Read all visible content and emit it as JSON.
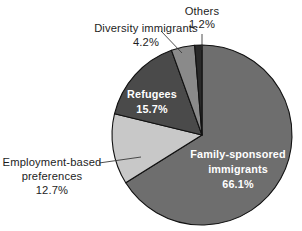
{
  "chart_data": {
    "type": "pie",
    "title": "",
    "subtitle": "",
    "xlabel": "",
    "ylabel": "",
    "legend_position": "none",
    "grid": false,
    "units": "percent",
    "total": 99.9,
    "start_angle_deg": 0,
    "direction": "clockwise",
    "categories": [
      "Family-sponsored immigrants",
      "Employment-based preferences",
      "Refugees",
      "Diversity immigrants",
      "Others"
    ],
    "values": [
      66.1,
      12.7,
      15.7,
      4.2,
      1.2
    ],
    "value_labels": [
      "66.1%",
      "12.7%",
      "15.7%",
      "4.2%",
      "1.2%"
    ],
    "colors": [
      "#6e6e6e",
      "#c8c8c8",
      "#4a4a4a",
      "#8a8a8a",
      "#2a2a2a"
    ],
    "slices": [
      {
        "name": "Family-sponsored immigrants",
        "value": 66.1,
        "value_label": "66.1%",
        "label_line1": "Family-sponsored",
        "label_line2": "immigrants",
        "color": "#6e6e6e",
        "label_placement": "inside",
        "label_color": "#ffffff",
        "start_deg": 0,
        "end_deg": 237.96
      },
      {
        "name": "Employment-based preferences",
        "value": 12.7,
        "value_label": "12.7%",
        "label_line1": "Employment-based",
        "label_line2": "preferences",
        "color": "#c8c8c8",
        "label_placement": "outside-left",
        "label_color": "#1d1d1d",
        "start_deg": 237.96,
        "end_deg": 283.68
      },
      {
        "name": "Refugees",
        "value": 15.7,
        "value_label": "15.7%",
        "label_line1": "Refugees",
        "label_line2": "",
        "color": "#4a4a4a",
        "label_placement": "inside",
        "label_color": "#ffffff",
        "start_deg": 283.68,
        "end_deg": 340.2
      },
      {
        "name": "Diversity immigrants",
        "value": 4.2,
        "value_label": "4.2%",
        "label_line1": "Diversity immigrants",
        "label_line2": "",
        "color": "#8a8a8a",
        "label_placement": "outside-top-left",
        "label_color": "#1d1d1d",
        "start_deg": 340.2,
        "end_deg": 355.32
      },
      {
        "name": "Others",
        "value": 1.2,
        "value_label": "1.2%",
        "label_line1": "Others",
        "label_line2": "",
        "color": "#2a2a2a",
        "label_placement": "outside-top",
        "label_color": "#1d1d1d",
        "start_deg": 355.32,
        "end_deg": 360.0
      }
    ],
    "geometry": {
      "center_x": 202,
      "center_y": 135,
      "radius": 90,
      "canvas_width": 302,
      "canvas_height": 231,
      "background": "#ffffff"
    }
  }
}
